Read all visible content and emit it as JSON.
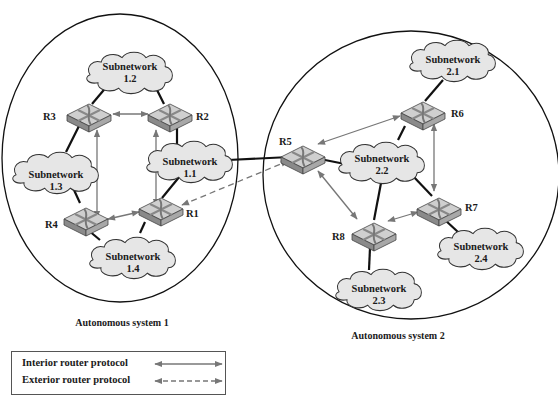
{
  "diagram": {
    "autonomous_systems": [
      {
        "id": "as1",
        "label": "Autonomous system 1"
      },
      {
        "id": "as2",
        "label": "Autonomous system 2"
      }
    ],
    "subnetworks": [
      {
        "id": "s11",
        "line1": "Subnetwork",
        "line2": "1.1"
      },
      {
        "id": "s12",
        "line1": "Subnetwork",
        "line2": "1.2"
      },
      {
        "id": "s13",
        "line1": "Subnetwork",
        "line2": "1.3"
      },
      {
        "id": "s14",
        "line1": "Subnetwork",
        "line2": "1.4"
      },
      {
        "id": "s21",
        "line1": "Subnetwork",
        "line2": "2.1"
      },
      {
        "id": "s22",
        "line1": "Subnetwork",
        "line2": "2.2"
      },
      {
        "id": "s23",
        "line1": "Subnetwork",
        "line2": "2.3"
      },
      {
        "id": "s24",
        "line1": "Subnetwork",
        "line2": "2.4"
      }
    ],
    "routers": [
      {
        "id": "R1",
        "label": "R1"
      },
      {
        "id": "R2",
        "label": "R2"
      },
      {
        "id": "R3",
        "label": "R3"
      },
      {
        "id": "R4",
        "label": "R4"
      },
      {
        "id": "R5",
        "label": "R5"
      },
      {
        "id": "R6",
        "label": "R6"
      },
      {
        "id": "R7",
        "label": "R7"
      },
      {
        "id": "R8",
        "label": "R8"
      }
    ],
    "legend": {
      "interior": "Interior router protocol",
      "exterior": "Exterior router protocol"
    },
    "colors": {
      "cloud_fill": "#e6e6e6",
      "router_top": "#c8c8c8",
      "protocol_arrow": "#777777",
      "link": "#111111"
    }
  }
}
